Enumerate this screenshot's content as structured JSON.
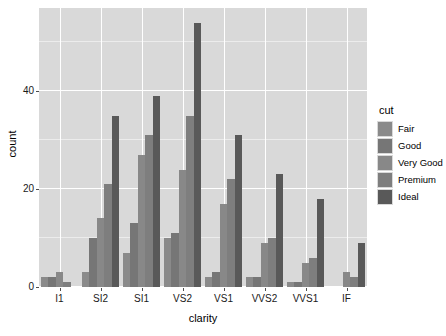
{
  "chart_data": {
    "type": "bar",
    "title": "",
    "xlabel": "clarity",
    "ylabel": "count",
    "categories": [
      "I1",
      "SI2",
      "SI1",
      "VS2",
      "VS1",
      "VVS2",
      "VVS1",
      "IF"
    ],
    "ylim": [
      0,
      57
    ],
    "yticks": [
      0,
      20,
      40
    ],
    "ytick_labels": [
      "0",
      "20",
      "40"
    ],
    "grid": true,
    "legend_position": "right",
    "legend_title": "cut",
    "series": [
      {
        "name": "Fair",
        "color": "#8a8a8a",
        "values": [
          2,
          3,
          7,
          10,
          2,
          2,
          1,
          0
        ]
      },
      {
        "name": "Good",
        "color": "#767676",
        "values": [
          2,
          10,
          13,
          11,
          3,
          2,
          1,
          0
        ]
      },
      {
        "name": "Very Good",
        "color": "#888888",
        "values": [
          3,
          14,
          27,
          24,
          17,
          9,
          5,
          3
        ]
      },
      {
        "name": "Premium",
        "color": "#7e7e7e",
        "values": [
          1,
          21,
          31,
          35,
          22,
          10,
          6,
          2
        ]
      },
      {
        "name": "Ideal",
        "color": "#595959",
        "values": [
          0,
          35,
          39,
          54,
          31,
          23,
          18,
          9
        ]
      }
    ]
  },
  "axes": {
    "y_title": "count",
    "x_title": "clarity",
    "y_tick_labels": [
      "0",
      "20",
      "40"
    ],
    "x_tick_labels": [
      "I1",
      "SI2",
      "SI1",
      "VS2",
      "VS1",
      "VVS2",
      "VVS1",
      "IF"
    ]
  },
  "legend": {
    "title": "cut",
    "items": [
      {
        "label": "Fair"
      },
      {
        "label": "Good"
      },
      {
        "label": "Very Good"
      },
      {
        "label": "Premium"
      },
      {
        "label": "Ideal"
      }
    ]
  },
  "colors": {
    "panel_background": "#d9d9d9",
    "major_grid": "#ffffff",
    "minor_grid": "#ececec",
    "page_background": "#ffffff",
    "axis_text": "#1a1a1a"
  }
}
